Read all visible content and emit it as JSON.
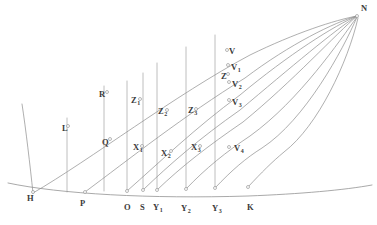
{
  "figure": {
    "background_color": "#ffffff",
    "stroke_color": "#8c8c8c",
    "label_color": "#3a3a3a",
    "width": 377,
    "height": 225
  },
  "labels": [
    {
      "id": "N",
      "text": "N",
      "sub": "",
      "x": 361,
      "y": 4,
      "role": "convergence-point"
    },
    {
      "id": "V",
      "text": "V",
      "sub": "",
      "x": 229,
      "y": 47,
      "role": "curve-intersection"
    },
    {
      "id": "V1",
      "text": "V",
      "sub": "1",
      "x": 231,
      "y": 63,
      "role": "curve-intersection"
    },
    {
      "id": "Z",
      "text": "Z",
      "sub": "",
      "x": 221,
      "y": 72,
      "role": "curve-intersection"
    },
    {
      "id": "V2",
      "text": "V",
      "sub": "2",
      "x": 232,
      "y": 80,
      "role": "curve-intersection"
    },
    {
      "id": "V3",
      "text": "V",
      "sub": "3",
      "x": 232,
      "y": 98,
      "role": "curve-intersection"
    },
    {
      "id": "R",
      "text": "R",
      "sub": "",
      "x": 99,
      "y": 90,
      "role": "curve-intersection"
    },
    {
      "id": "Z1",
      "text": "Z",
      "sub": "1",
      "x": 131,
      "y": 96,
      "role": "curve-intersection"
    },
    {
      "id": "Z2",
      "text": "Z",
      "sub": "2",
      "x": 158,
      "y": 107,
      "role": "curve-intersection"
    },
    {
      "id": "Z3",
      "text": "Z",
      "sub": "3",
      "x": 188,
      "y": 106,
      "role": "curve-intersection"
    },
    {
      "id": "L",
      "text": "L",
      "sub": "",
      "x": 62,
      "y": 124,
      "role": "curve-intersection"
    },
    {
      "id": "Q",
      "text": "Q",
      "sub": "",
      "x": 102,
      "y": 138,
      "role": "curve-intersection"
    },
    {
      "id": "X1",
      "text": "X",
      "sub": "1",
      "x": 133,
      "y": 143,
      "role": "curve-intersection"
    },
    {
      "id": "X2",
      "text": "X",
      "sub": "2",
      "x": 161,
      "y": 149,
      "role": "curve-intersection"
    },
    {
      "id": "X3",
      "text": "X",
      "sub": "3",
      "x": 191,
      "y": 143,
      "role": "curve-intersection"
    },
    {
      "id": "V4",
      "text": "V",
      "sub": "4",
      "x": 234,
      "y": 144,
      "role": "curve-intersection"
    },
    {
      "id": "H",
      "text": "H",
      "sub": "",
      "x": 27,
      "y": 194,
      "role": "baseline-point"
    },
    {
      "id": "P",
      "text": "P",
      "sub": "",
      "x": 80,
      "y": 199,
      "role": "baseline-point"
    },
    {
      "id": "O",
      "text": "O",
      "sub": "",
      "x": 124,
      "y": 203,
      "role": "baseline-point"
    },
    {
      "id": "S",
      "text": "S",
      "sub": "",
      "x": 140,
      "y": 203,
      "role": "baseline-point"
    },
    {
      "id": "Y1",
      "text": "Y",
      "sub": "1",
      "x": 153,
      "y": 203,
      "role": "baseline-point"
    },
    {
      "id": "Y2",
      "text": "Y",
      "sub": "2",
      "x": 181,
      "y": 204,
      "role": "baseline-point"
    },
    {
      "id": "Y3",
      "text": "Y",
      "sub": "3",
      "x": 212,
      "y": 204,
      "role": "baseline-point"
    },
    {
      "id": "K",
      "text": "K",
      "sub": "",
      "x": 247,
      "y": 203,
      "role": "baseline-point"
    }
  ],
  "geometry": {
    "baseline": "M 8 183 C 60 194 150 199 248 196 C 300 194 345 190 372 185",
    "curves": [
      {
        "name": "curve-H-N",
        "d": "M 33 193 C 90 160 175 95 250 55 C 295 33 335 20 357 16"
      },
      {
        "name": "curve-P-N",
        "d": "M 85 192 C 128 160 185 115 245 78 C 290 44 335 22 357 16"
      },
      {
        "name": "curve-O-N",
        "d": "M 127 191 C 160 162 195 128 240 95 C 288 55 335 25 357 16"
      },
      {
        "name": "curve-S-N",
        "d": "M 143 190 C 170 164 200 138 240 110 C 290 68 336 29 357 16"
      },
      {
        "name": "curve-Y1-N",
        "d": "M 157 190 C 182 166 208 146 243 122 C 292 82 337 33 357 16"
      },
      {
        "name": "curve-Y2-N",
        "d": "M 186 189 C 206 168 226 152 250 136 C 300 100 340 40 357 17"
      },
      {
        "name": "curve-Y3-N",
        "d": "M 215 188 C 232 170 246 158 262 148 C 305 120 343 50 357 17"
      },
      {
        "name": "curve-K-N",
        "d": "M 248 187 C 262 172 272 162 284 152 C 318 126 348 62 358 18"
      },
      {
        "name": "curve-left-rising",
        "d": "M 22 104 C 26 130 30 165 33 193"
      }
    ],
    "ordinates": [
      {
        "name": "ordinate-O",
        "x1": 127,
        "y1": 191,
        "x2": 127,
        "y2": 81
      },
      {
        "name": "ordinate-S",
        "x1": 143,
        "y1": 190,
        "x2": 143,
        "y2": 73
      },
      {
        "name": "ordinate-Y1",
        "x1": 157,
        "y1": 190,
        "x2": 157,
        "y2": 63
      },
      {
        "name": "ordinate-Y2",
        "x1": 186,
        "y1": 189,
        "x2": 186,
        "y2": 47
      },
      {
        "name": "ordinate-Y3",
        "x1": 215,
        "y1": 188,
        "x2": 215,
        "y2": 35
      },
      {
        "name": "ordinate-L",
        "x1": 67,
        "y1": 192,
        "x2": 67,
        "y2": 118
      },
      {
        "name": "ordinate-R",
        "x1": 104,
        "y1": 191,
        "x2": 104,
        "y2": 86
      }
    ],
    "nodes": [
      {
        "name": "node-H",
        "cx": 33,
        "cy": 192
      },
      {
        "name": "node-P",
        "cx": 85,
        "cy": 192
      },
      {
        "name": "node-O",
        "cx": 127,
        "cy": 191
      },
      {
        "name": "node-S",
        "cx": 143,
        "cy": 190
      },
      {
        "name": "node-Y1",
        "cx": 157,
        "cy": 190
      },
      {
        "name": "node-Y2",
        "cx": 186,
        "cy": 189
      },
      {
        "name": "node-Y3",
        "cx": 215,
        "cy": 188
      },
      {
        "name": "node-K",
        "cx": 248,
        "cy": 187
      },
      {
        "name": "node-L",
        "cx": 68,
        "cy": 126
      },
      {
        "name": "node-Q",
        "cx": 110,
        "cy": 139
      },
      {
        "name": "node-R",
        "cx": 107,
        "cy": 92
      },
      {
        "name": "node-X1",
        "cx": 142,
        "cy": 146
      },
      {
        "name": "node-X2",
        "cx": 171,
        "cy": 151
      },
      {
        "name": "node-X3",
        "cx": 200,
        "cy": 146
      },
      {
        "name": "node-Z1",
        "cx": 140,
        "cy": 99
      },
      {
        "name": "node-Z2",
        "cx": 167,
        "cy": 110
      },
      {
        "name": "node-Z3",
        "cx": 196,
        "cy": 109
      },
      {
        "name": "node-Z",
        "cx": 228,
        "cy": 74
      },
      {
        "name": "node-V",
        "cx": 227,
        "cy": 50
      },
      {
        "name": "node-V1",
        "cx": 228,
        "cy": 65
      },
      {
        "name": "node-V2",
        "cx": 229,
        "cy": 82
      },
      {
        "name": "node-V3",
        "cx": 229,
        "cy": 100
      },
      {
        "name": "node-V4",
        "cx": 229,
        "cy": 147
      },
      {
        "name": "node-N",
        "cx": 357,
        "cy": 16
      }
    ]
  }
}
